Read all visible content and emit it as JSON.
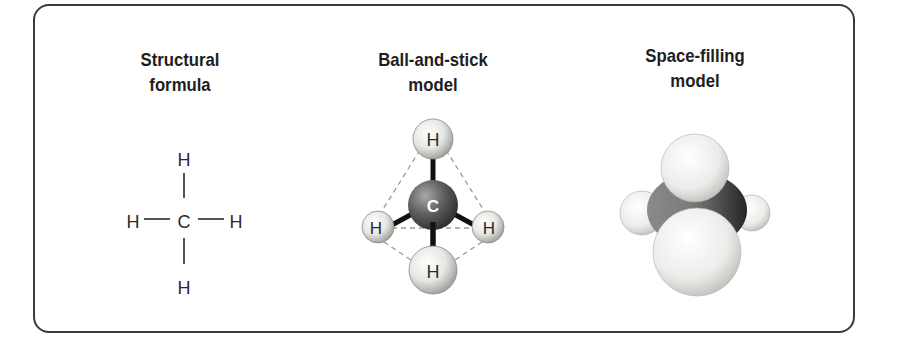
{
  "panels": [
    {
      "id": "structural",
      "title_line1": "Structural",
      "title_line2": "formula",
      "atoms": {
        "center": "C",
        "top": "H",
        "left": "H",
        "right": "H",
        "bottom": "H"
      }
    },
    {
      "id": "ball-and-stick",
      "title_line1": "Ball-and-stick",
      "title_line2": "model",
      "atoms": {
        "center": "C",
        "top": "H",
        "left": "H",
        "right": "H",
        "bottom": "H"
      }
    },
    {
      "id": "space-filling",
      "title_line1": "Space-filling",
      "title_line2": "model"
    }
  ],
  "colors": {
    "border": "#3a3a3a",
    "text": "#1e1e1e",
    "hydrogen": "#e8e8e4",
    "carbon": "#5a5a5a",
    "dashed": "#9a9a9a"
  }
}
